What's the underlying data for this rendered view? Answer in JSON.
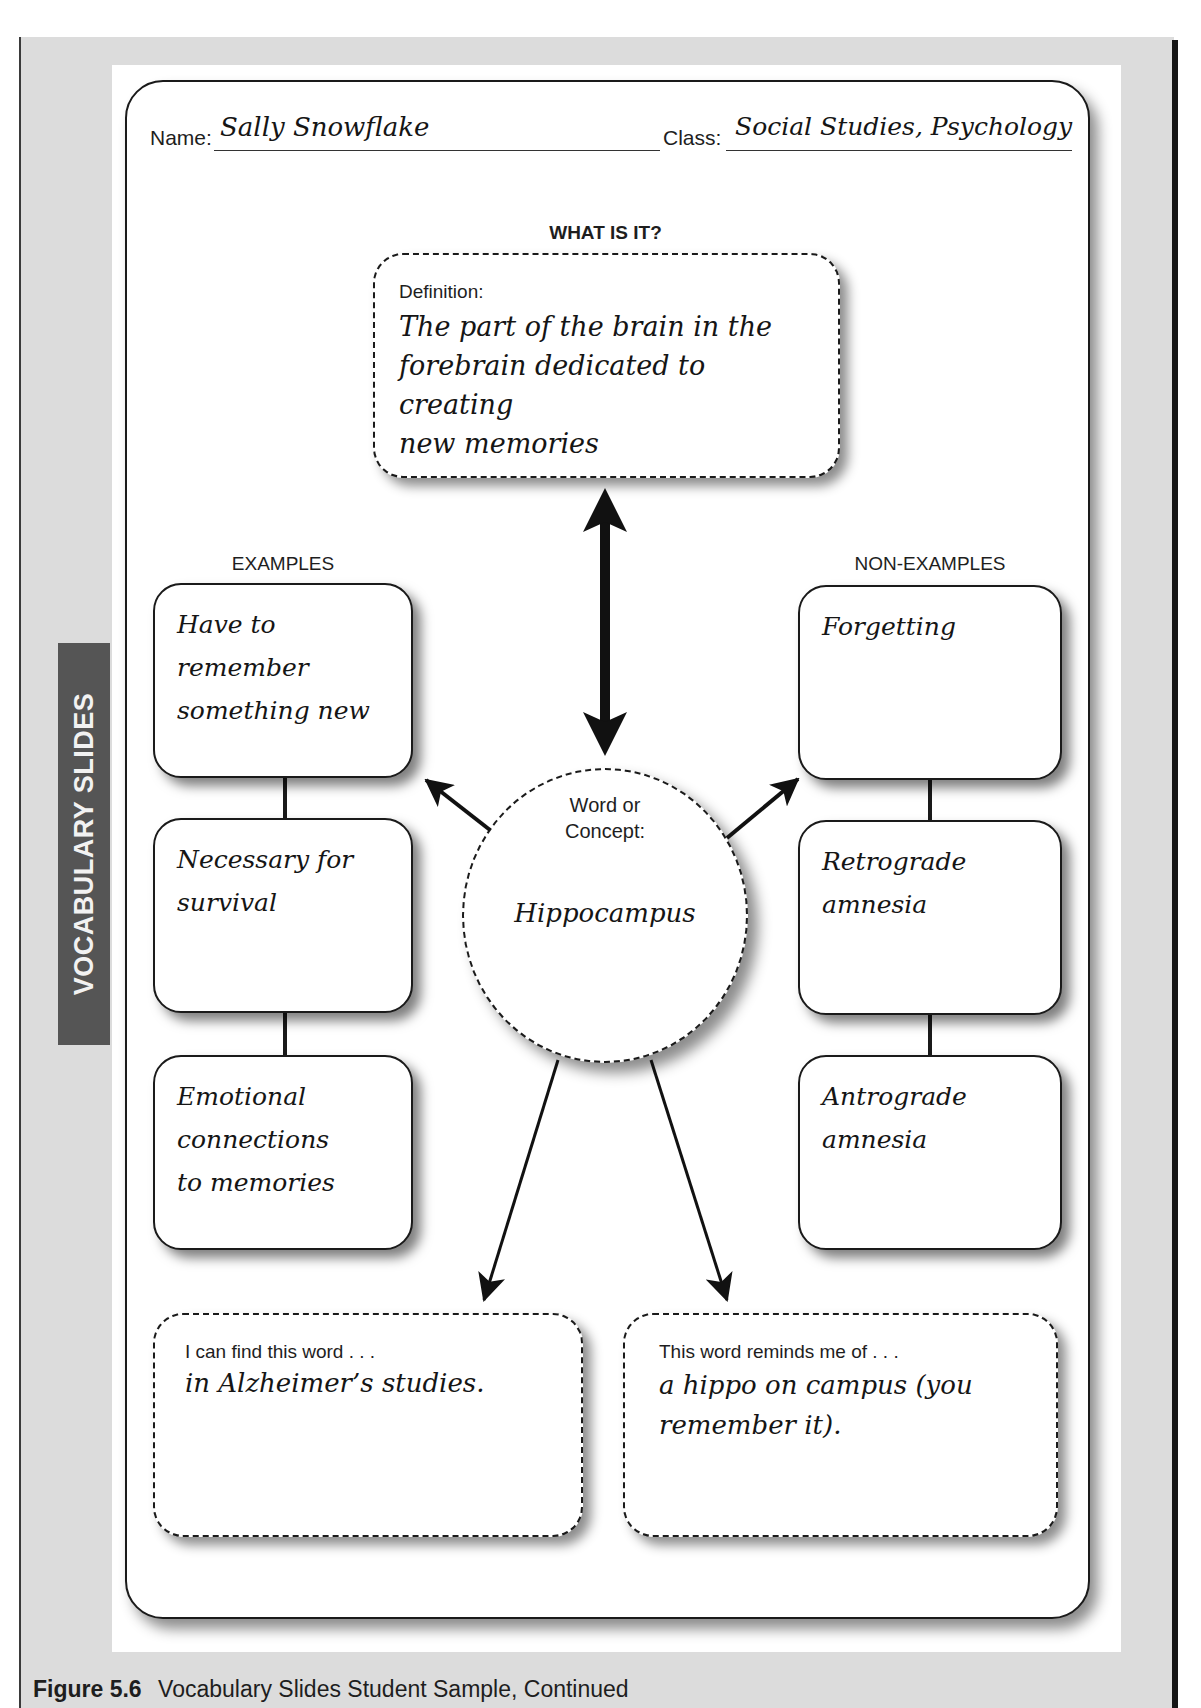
{
  "side_tab": {
    "label": "VOCABULARY SLIDES"
  },
  "header": {
    "name_label": "Name:",
    "name_value": "Sally Snowflake",
    "class_label": "Class:",
    "class_value": "Social Studies, Psychology"
  },
  "definition": {
    "heading": "WHAT IS IT?",
    "label": "Definition:",
    "lines": [
      "The part of the brain in the",
      "forebrain dedicated to creating",
      "new memories"
    ]
  },
  "examples": {
    "heading": "EXAMPLES",
    "items": [
      {
        "lines": [
          "Have to",
          "remember",
          "something new"
        ]
      },
      {
        "lines": [
          "Necessary for",
          "survival"
        ]
      },
      {
        "lines": [
          "Emotional",
          "connections",
          "to memories"
        ]
      }
    ]
  },
  "non_examples": {
    "heading": "NON-EXAMPLES",
    "items": [
      {
        "lines": [
          "Forgetting"
        ]
      },
      {
        "lines": [
          "Retrograde",
          "amnesia"
        ]
      },
      {
        "lines": [
          "Antrograde",
          "amnesia"
        ]
      }
    ]
  },
  "concept": {
    "label_line1": "Word or",
    "label_line2": "Concept:",
    "value": "Hippocampus"
  },
  "find_word": {
    "label": "I can find this word . . .",
    "value": "in Alzheimer’s studies."
  },
  "reminds_me": {
    "label": "This word reminds me of . . .",
    "lines": [
      "a hippo on  campus (you",
      "remember it)."
    ]
  },
  "caption": {
    "figure": "Figure 5.6",
    "text": "Vocabulary Slides Student Sample, Continued"
  }
}
